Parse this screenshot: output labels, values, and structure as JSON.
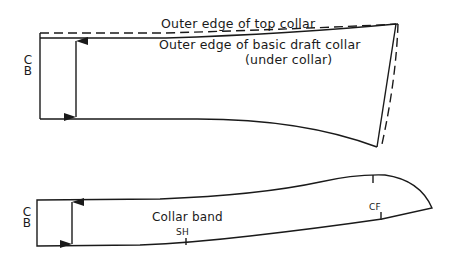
{
  "diagram": {
    "type": "pattern-drafting",
    "colors": {
      "ink": "#1a1a1a",
      "background": "#ffffff"
    },
    "top_piece": {
      "name": "collar",
      "labels": {
        "center_back": [
          "C",
          "B"
        ],
        "top_collar": "Outer edge of top collar",
        "basic_draft_line1": "Outer edge of basic draft collar",
        "basic_draft_line2": "(under collar)"
      }
    },
    "bottom_piece": {
      "name": "collar-band",
      "labels": {
        "center_back": [
          "C",
          "B"
        ],
        "title": "Collar band",
        "shoulder_mark": "SH",
        "center_front_mark": "CF"
      }
    }
  }
}
